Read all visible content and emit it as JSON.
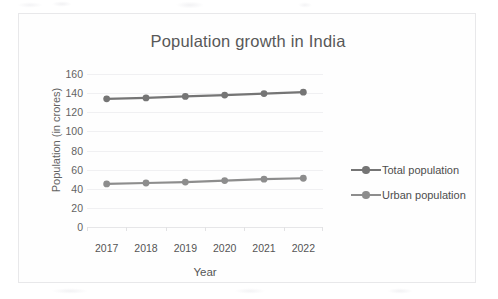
{
  "chart_data": {
    "type": "line",
    "title": "Population growth in India",
    "xlabel": "Year",
    "ylabel": "Population (in crores)",
    "categories": [
      "2017",
      "2018",
      "2019",
      "2020",
      "2021",
      "2022"
    ],
    "series": [
      {
        "name": "Total population",
        "values": [
          134,
          135,
          136.5,
          138,
          139.5,
          141
        ],
        "color": "#757575",
        "marker": "circle"
      },
      {
        "name": "Urban population",
        "values": [
          45,
          46,
          47,
          48.5,
          50,
          51
        ],
        "color": "#8d8d8d",
        "marker": "circle"
      }
    ],
    "ylim": [
      0,
      160
    ],
    "ytick_labels": [
      "0",
      "20",
      "40",
      "60",
      "80",
      "100",
      "120",
      "140",
      "160"
    ],
    "ytick_values": [
      0,
      20,
      40,
      60,
      80,
      100,
      120,
      140,
      160
    ],
    "grid": true,
    "legend_position": "right"
  },
  "legend": {
    "entries": [
      {
        "label": "Total population",
        "color": "#757575"
      },
      {
        "label": "Urban population",
        "color": "#8d8d8d"
      }
    ]
  },
  "colors": {
    "total_population": "#757575",
    "urban_population": "#8d8d8d",
    "gridline": "#f0f0f2",
    "frame_border": "#e8e8ea",
    "title_text": "#585858",
    "axis_text": "#636363"
  }
}
